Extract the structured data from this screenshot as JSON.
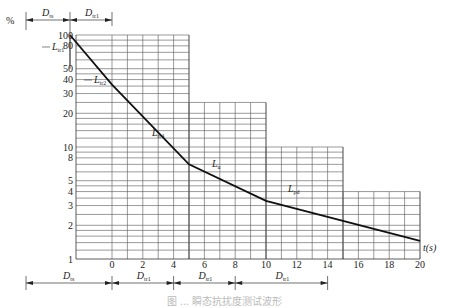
{
  "chart_data": {
    "type": "line",
    "title": "",
    "xlabel": "t(s)",
    "ylabel": "%",
    "yscale": "log",
    "xlim": [
      -2.7,
      20
    ],
    "ylim": [
      1,
      100
    ],
    "x_ticks": [
      0,
      2,
      4,
      6,
      8,
      10,
      12,
      14,
      16,
      18,
      20
    ],
    "y_ticks": [
      1,
      2,
      3,
      4,
      5,
      8,
      10,
      20,
      30,
      40,
      50,
      80,
      100
    ],
    "grid": true,
    "series": [
      {
        "name": "tolerance boundary",
        "points": [
          {
            "t": -2.7,
            "pct": 100
          },
          {
            "t": 0,
            "pct": 36
          },
          {
            "t": 5,
            "pct": 7
          },
          {
            "t": 10,
            "pct": 3.3
          },
          {
            "t": 20,
            "pct": 1.45
          }
        ]
      }
    ],
    "grid_regions": [
      {
        "t_from": -2.7,
        "t_to": 5,
        "pct_top": 100
      },
      {
        "t_from": 5,
        "t_to": 10,
        "pct_top": 25
      },
      {
        "t_from": 10,
        "t_to": 15,
        "pct_top": 10
      },
      {
        "t_from": 15,
        "t_to": 20,
        "pct_top": 4
      }
    ],
    "annotations": [
      {
        "text": "L_tr1",
        "main": "L",
        "sub": "tr1"
      },
      {
        "text": "L_tr2",
        "main": "L",
        "sub": "tr2"
      },
      {
        "text": "L_tr4",
        "main": "L",
        "sub": "tr4"
      },
      {
        "text": "L_u",
        "main": "L",
        "sub": "u"
      },
      {
        "text": "L_pd",
        "main": "L",
        "sub": "pd"
      }
    ],
    "dimension_top": [
      {
        "label": "D_ts",
        "main": "D",
        "sub": "ts"
      },
      {
        "label": "D_tr1",
        "main": "D",
        "sub": "tr1"
      }
    ],
    "dimension_bottom": [
      {
        "label": "D_ts",
        "main": "D",
        "sub": "ts",
        "t_from": -2.7,
        "t_to": 0
      },
      {
        "label": "D_tr1",
        "main": "D",
        "sub": "tr1",
        "t_from": 0,
        "t_to": 4
      },
      {
        "label": "D_tr1",
        "main": "D",
        "sub": "tr1",
        "t_from": 4,
        "t_to": 8
      },
      {
        "label": "D_tr1",
        "main": "D",
        "sub": "tr1",
        "t_from": 8,
        "t_to": 14
      }
    ]
  },
  "ui": {
    "y_unit": "%",
    "x_unit": "t(s)",
    "caption": "图 ... 瞬态抗扰度测试波形"
  }
}
